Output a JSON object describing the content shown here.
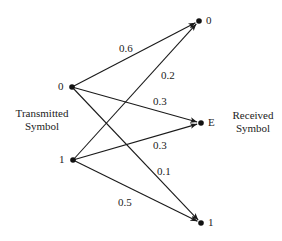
{
  "diagram": {
    "type": "channel-transition-diagram",
    "transmitted": {
      "title_line1": "Transmitted",
      "title_line2": "Symbol",
      "nodes": [
        {
          "id": "t0",
          "label": "0",
          "x": 72,
          "y": 87
        },
        {
          "id": "t1",
          "label": "1",
          "x": 73,
          "y": 160
        }
      ]
    },
    "received": {
      "title_line1": "Received",
      "title_line2": "Symbol",
      "nodes": [
        {
          "id": "r0",
          "label": "0",
          "x": 199,
          "y": 21
        },
        {
          "id": "rE",
          "label": "E",
          "x": 201,
          "y": 123
        },
        {
          "id": "r1",
          "label": "1",
          "x": 201,
          "y": 223
        }
      ]
    },
    "edges": [
      {
        "from": "t0",
        "to": "r0",
        "prob": "0.6",
        "label_x": 119,
        "label_y": 42
      },
      {
        "from": "t0",
        "to": "rE",
        "prob": "0.3",
        "label_x": 153,
        "label_y": 95
      },
      {
        "from": "t0",
        "to": "r1",
        "prob": "0.1",
        "label_x": 157,
        "label_y": 165
      },
      {
        "from": "t1",
        "to": "r0",
        "prob": "0.2",
        "label_x": 161,
        "label_y": 69
      },
      {
        "from": "t1",
        "to": "rE",
        "prob": "0.3",
        "label_x": 153,
        "label_y": 139
      },
      {
        "from": "t1",
        "to": "r1",
        "prob": "0.5",
        "label_x": 118,
        "label_y": 196
      }
    ],
    "colors": {
      "line": "#1a1a1a",
      "node": "#111111",
      "text": "#222222",
      "background": "#ffffff"
    }
  }
}
